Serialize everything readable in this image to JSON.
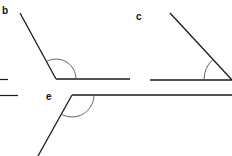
{
  "diagram": {
    "type": "angle-figures",
    "stroke_color": "#1a1a1a",
    "arc_color": "#555555",
    "labels": {
      "b": "b",
      "c": "c",
      "e": "e"
    },
    "figures": [
      {
        "id": "b",
        "description": "obtuse angle",
        "vertex": [
          56,
          79
        ],
        "arms": [
          [
            20,
            13
          ],
          [
            130,
            79
          ]
        ],
        "arc_radius": 20
      },
      {
        "id": "c",
        "description": "acute angle",
        "vertex": [
          232,
          80
        ],
        "arms": [
          [
            170,
            13
          ],
          [
            150,
            80
          ]
        ],
        "arc_radius": 28
      },
      {
        "id": "e",
        "description": "obtuse angle (inverted)",
        "vertex": [
          72,
          95
        ],
        "arms": [
          [
            232,
            95
          ],
          [
            38,
            156
          ]
        ],
        "arc_radius": 22
      }
    ]
  }
}
